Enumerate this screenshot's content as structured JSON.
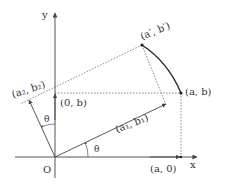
{
  "diagram": {
    "axes": {
      "x_label": "x",
      "y_label": "y",
      "origin_label": "O"
    },
    "points": {
      "a_b": "(a, b)",
      "a_prime_b_prime": "(a′, b′)",
      "zero_b": "(0, b)",
      "a_zero": "(a, 0)",
      "a1_b1": "(a₁, b₁)",
      "a2_b2": "(a₂, b₂)"
    },
    "angles": {
      "theta_x": "θ",
      "theta_y": "θ"
    },
    "colors": {
      "line": "#444444",
      "arc": "#222222",
      "text": "#333333"
    }
  }
}
